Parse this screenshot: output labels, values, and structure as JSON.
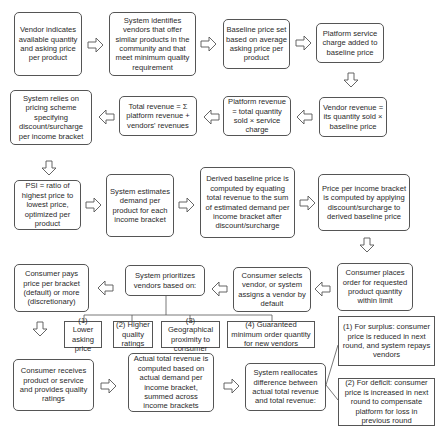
{
  "diagram": {
    "title": "",
    "steps": {
      "vendor_indicates": "Vendor indicates available quantity and asking price per product",
      "system_identifies": "System identifies vendors that offer similar products in the community and that meet minimum quality requirement",
      "baseline_price": "Baseline price set based on average asking price per product",
      "service_charge": "Platform service charge added to baseline price",
      "vendor_revenue": "Vendor revenue = its quantity sold × baseline price",
      "platform_revenue": "Platform revenue = total quantity sold × service charge",
      "total_revenue": "Total revenue = Σ platform revenue + vendors' revenues",
      "pricing_scheme": "System relies on pricing scheme specifying discount/surcharge per income bracket",
      "psi": "PSI = ratio of highest price to lowest price, optimized per product",
      "estimates_demand": "System estimates demand per product for each income bracket",
      "derived_baseline": "Derived baseline price is computed by equating total revenue to the sum of estimated demand per income bracket after discount/surcharge",
      "price_per_bracket": "Price per income bracket is computed by applying discount/surcharge to derived baseline price",
      "consumer_places": "Consumer places order for requested product quantity within limit",
      "consumer_selects": "Consumer selects vendor, or system assigns a vendor by default",
      "system_prioritizes": "System prioritizes vendors based on:",
      "consumer_pays": "Consumer pays price per bracket (default) or more (discretionary)",
      "consumer_receives": "Consumer receives product or service and provides quality ratings",
      "actual_revenue": "Actual total revenue is computed based on actual demand per income bracket, summed across income brackets",
      "reallocates": "System reallocates difference between actual total revenue and total revenue:"
    },
    "criteria": [
      "(1) Lower asking price",
      "(2) Higher quality ratings",
      "(3) Geographical proximity to consumer",
      "(4) Guaranteed minimum order quantity for new vendors"
    ],
    "outcomes": {
      "surplus": "(1) For surplus: consumer price is reduced in next round, and system repays vendors",
      "deficit": "(2) For deficit: consumer price is increased in next round to compensate platform for loss in previous round"
    },
    "colors": {
      "stroke": "#555555",
      "background": "#ffffff",
      "text": "#2a2a2a"
    }
  }
}
